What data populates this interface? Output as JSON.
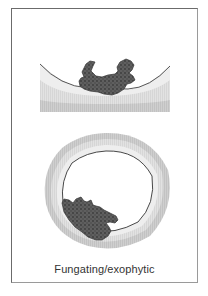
{
  "figure": {
    "caption": "Fungating/exophytic",
    "panels": [
      {
        "name": "longitudinal-section",
        "description": "Wall cross-section with exophytic tumor mass protruding from mucosal surface"
      },
      {
        "name": "transverse-section",
        "description": "Ring-shaped bowel cross-section with fungating tumor on inner wall"
      }
    ],
    "colors": {
      "frame": "#6b6b6b",
      "tumor_fill": "#5a5a5a",
      "tumor_dots": "#3a3a3a",
      "wall_outer": "#c9c9c9",
      "wall_mid": "#dcdcdc",
      "wall_inner": "#ececec",
      "mucosa_line": "#444444",
      "caption": "#333333"
    }
  }
}
